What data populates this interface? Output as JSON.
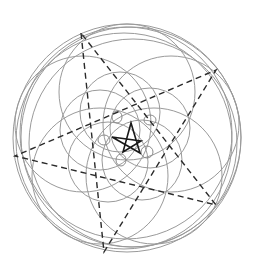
{
  "figure": {
    "colors": {
      "background": "#ffffff",
      "circles": "#9a9a9a",
      "loops": "#8a8a8a",
      "dashed_pentagram": "#2a2a2a",
      "central_star": "#1a1a1a"
    },
    "outer_circles": [
      {
        "cx": 127,
        "cy": 138,
        "r": 114
      },
      {
        "cx": 131,
        "cy": 137,
        "r": 110
      },
      {
        "cx": 124,
        "cy": 141,
        "r": 108
      },
      {
        "cx": 126,
        "cy": 133,
        "r": 106
      },
      {
        "cx": 133,
        "cy": 143,
        "r": 104
      }
    ],
    "inner_circles": [
      {
        "cx": 127,
        "cy": 92,
        "r": 68
      },
      {
        "cx": 171,
        "cy": 124,
        "r": 68
      },
      {
        "cx": 154,
        "cy": 176,
        "r": 68
      },
      {
        "cx": 100,
        "cy": 176,
        "r": 68
      },
      {
        "cx": 83,
        "cy": 124,
        "r": 68
      },
      {
        "cx": 120,
        "cy": 112,
        "r": 40
      },
      {
        "cx": 150,
        "cy": 128,
        "r": 40
      },
      {
        "cx": 142,
        "cy": 160,
        "r": 40
      },
      {
        "cx": 108,
        "cy": 162,
        "r": 40
      },
      {
        "cx": 100,
        "cy": 130,
        "r": 40
      }
    ],
    "loops": [
      {
        "cx": 117,
        "cy": 117,
        "rx": 5,
        "ry": 6
      },
      {
        "cx": 150,
        "cy": 120,
        "rx": 6,
        "ry": 5
      },
      {
        "cx": 147,
        "cy": 152,
        "rx": 6,
        "ry": 6
      },
      {
        "cx": 121,
        "cy": 160,
        "rx": 5,
        "ry": 6
      },
      {
        "cx": 104,
        "cy": 140,
        "rx": 6,
        "ry": 5
      }
    ],
    "dashed_pentagram_vertices": [
      [
        81,
        33
      ],
      [
        104,
        252
      ],
      [
        216,
        70
      ],
      [
        15,
        156
      ],
      [
        216,
        205
      ]
    ],
    "central_star_vertices": [
      [
        131,
        123
      ],
      [
        123,
        152
      ],
      [
        141,
        141
      ],
      [
        112,
        137
      ],
      [
        140,
        153
      ]
    ]
  }
}
